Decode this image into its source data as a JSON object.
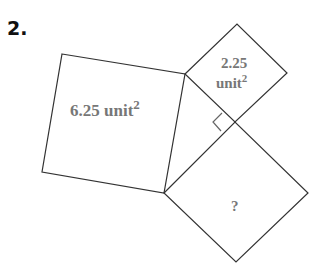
{
  "problem_number": "2.",
  "squares": [
    {
      "id": "large",
      "area_value": "6.25 unit",
      "exponent": "2"
    },
    {
      "id": "small",
      "area_value_line1": "2.25",
      "area_value_line2": "unit",
      "exponent": "2"
    },
    {
      "id": "unknown",
      "label": "?"
    }
  ],
  "colors": {
    "stroke": "#333333",
    "label": "#777777"
  }
}
